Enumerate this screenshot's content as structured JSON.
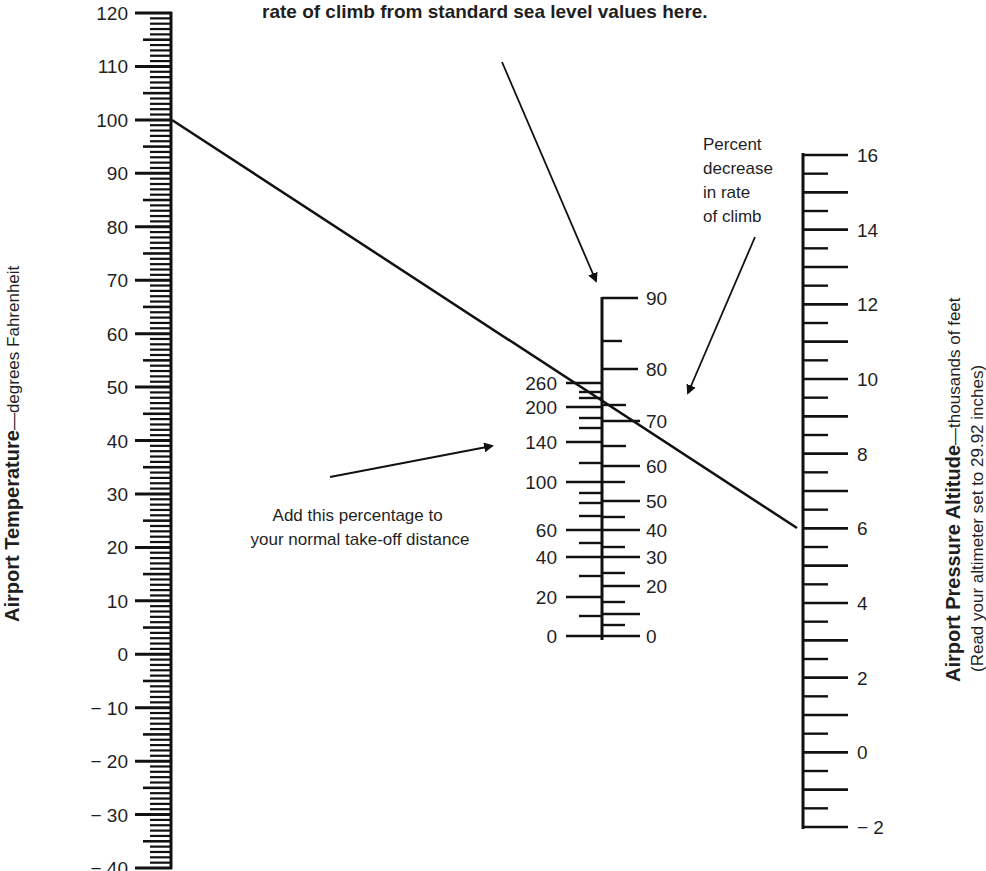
{
  "top_note": {
    "line2": "rate of climb from standard sea level values here."
  },
  "left_scale": {
    "title_bold": "Airport Temperature",
    "title_rest": "—degrees Fahrenheit",
    "labels": [
      "120",
      "110",
      "100",
      "90",
      "80",
      "70",
      "60",
      "50",
      "40",
      "30",
      "20",
      "10",
      "0",
      "− 10",
      "− 20",
      "− 30",
      "− 40"
    ]
  },
  "middle_scale": {
    "left_labels": [
      "260",
      "200",
      "140",
      "100",
      "60",
      "40",
      "20",
      "0"
    ],
    "right_labels": [
      "90",
      "80",
      "70",
      "60",
      "50",
      "40",
      "30",
      "20",
      "0"
    ],
    "note_left_line1": "Add this percentage to",
    "note_left_line2": "your normal take-off distance",
    "note_right_line1": "Percent",
    "note_right_line2": "decrease",
    "note_right_line3": "in rate",
    "note_right_line4": "of climb"
  },
  "right_scale": {
    "title_bold": "Airport Pressure Altitude",
    "title_rest": "—thousands of feet",
    "subtitle": "(Read your altimeter set to 29.92 inches)",
    "labels": [
      "16",
      "14",
      "12",
      "10",
      "8",
      "6",
      "4",
      "2",
      "0",
      "− 2"
    ]
  },
  "example_line": {
    "from_temperature_f": 100,
    "to_pressure_altitude_kft": 6,
    "color": "#111111"
  },
  "chart_data": {
    "type": "nomogram",
    "scales": [
      {
        "name": "Airport Temperature (°F)",
        "min": -40,
        "max": 120,
        "major_step": 10,
        "minor_step": 1
      },
      {
        "name": "Percent increase in take-off distance",
        "labels": [
          0,
          20,
          40,
          60,
          100,
          140,
          200,
          260
        ]
      },
      {
        "name": "Percent decrease in rate of climb",
        "labels": [
          0,
          20,
          30,
          40,
          50,
          60,
          70,
          80,
          90
        ]
      },
      {
        "name": "Airport Pressure Altitude (thousands of feet)",
        "min": -2,
        "max": 16,
        "major_step": 2,
        "minor_step": 0.5
      }
    ],
    "example": {
      "temperature_f": 100,
      "pressure_altitude_kft": 6,
      "takeoff_increase_pct": 230,
      "climb_decrease_pct": 76
    }
  }
}
